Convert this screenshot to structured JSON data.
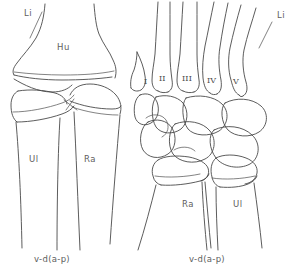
{
  "figure": {
    "background_color": "#ffffff",
    "line_color": "#4a4a4a",
    "text_color": "#5e5e5e",
    "width": 304,
    "height": 276
  },
  "panels": [
    {
      "id": "left-panel",
      "name": "elbow-antebrachium-view",
      "projection_label": "v-d(a-p)",
      "labels": [
        {
          "name": "limb-axis-label",
          "text": "Li",
          "x": 24,
          "y": 16
        },
        {
          "name": "humerus-label",
          "text": "Hu",
          "x": 57,
          "y": 50
        },
        {
          "name": "ulna-label",
          "text": "Ul",
          "x": 29,
          "y": 162
        },
        {
          "name": "radius-label",
          "text": "Ra",
          "x": 84,
          "y": 162
        }
      ],
      "projection_x": 34,
      "projection_y": 262
    },
    {
      "id": "right-panel",
      "name": "carpus-manus-view",
      "projection_label": "v-d(a-p)",
      "labels": [
        {
          "name": "limb-axis-label",
          "text": "Li",
          "x": 277,
          "y": 18
        },
        {
          "name": "radius-label",
          "text": "Ra",
          "x": 182,
          "y": 207
        },
        {
          "name": "ulna-label",
          "text": "Ul",
          "x": 233,
          "y": 207
        }
      ],
      "metacarpal_labels": [
        {
          "name": "metacarpal-label-1",
          "text": "I",
          "x": 146,
          "y": 84
        },
        {
          "name": "metacarpal-label-2",
          "text": "II",
          "x": 164,
          "y": 81
        },
        {
          "name": "metacarpal-label-3",
          "text": "III",
          "x": 184,
          "y": 81
        },
        {
          "name": "metacarpal-label-4",
          "text": "IV",
          "x": 210,
          "y": 82
        },
        {
          "name": "metacarpal-label-5",
          "text": "V",
          "x": 233,
          "y": 83
        }
      ],
      "projection_x": 189,
      "projection_y": 262
    }
  ]
}
